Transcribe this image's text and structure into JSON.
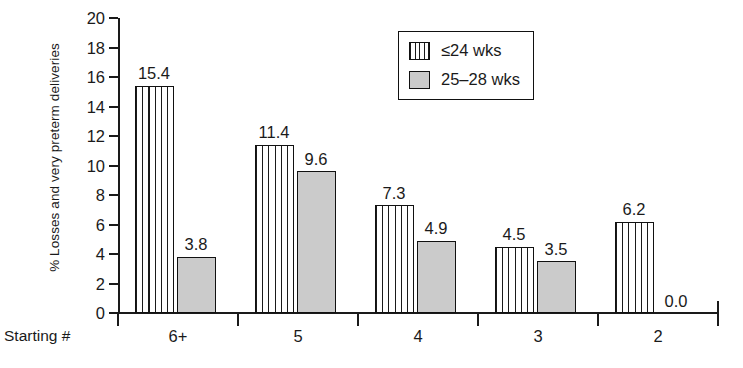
{
  "chart_data": {
    "type": "bar",
    "title": "",
    "xlabel": "Starting #",
    "ylabel": "% Losses and very preterm deliveries",
    "categories": [
      "6+",
      "5",
      "4",
      "3",
      "2"
    ],
    "ylim": [
      0,
      20
    ],
    "yticks": [
      0,
      2,
      4,
      6,
      8,
      10,
      12,
      14,
      16,
      18,
      20
    ],
    "grid": false,
    "legend_position": "top-center",
    "series": [
      {
        "name": "≤24 wks",
        "style": "vertical-stripes",
        "values": [
          15.4,
          11.4,
          7.3,
          4.5,
          6.2
        ],
        "labels": [
          "15.4",
          "11.4",
          "7.3",
          "4.5",
          "6.2"
        ]
      },
      {
        "name": "25–28 wks",
        "style": "solid-gray",
        "color": "#cbcbcb",
        "values": [
          3.8,
          9.6,
          4.9,
          3.5,
          0.0
        ],
        "labels": [
          "3.8",
          "9.6",
          "4.9",
          "3.5",
          "0.0"
        ]
      }
    ]
  },
  "axis": {
    "y_title": "% Losses and very preterm deliveries",
    "x_prefix": "Starting #",
    "tick_labels": [
      "0",
      "2",
      "4",
      "6",
      "8",
      "10",
      "12",
      "14",
      "16",
      "18",
      "20"
    ],
    "category_labels": [
      "6+",
      "5",
      "4",
      "3",
      "2"
    ]
  },
  "legend": {
    "items": [
      {
        "label": "≤24 wks",
        "swatch": "striped-swatch"
      },
      {
        "label": "25–28 wks",
        "swatch": "gray-swatch"
      }
    ]
  }
}
